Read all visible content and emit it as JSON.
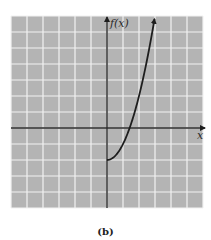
{
  "chart_data": {
    "type": "line",
    "title": "",
    "caption": "(b)",
    "xlabel": "x",
    "ylabel": "f(x)",
    "grid": true,
    "xlim": [
      -6,
      6
    ],
    "ylim": [
      -5,
      7
    ],
    "unit_px": 16,
    "function": "f(x) = x^2 - 2, x >= 0",
    "series": [
      {
        "name": "f(x)",
        "x": [
          0,
          0.5,
          1,
          1.414,
          2,
          2.5,
          3
        ],
        "y": [
          -2,
          -1.75,
          -1,
          0,
          2,
          4.25,
          7
        ]
      }
    ],
    "endpoint_arrow": "top",
    "colors": {
      "grid_background": "#b4b4b4",
      "grid_lines": "#f2f2f2",
      "axes": "#2a2a2a",
      "curve": "#1e1e1e"
    }
  },
  "labels": {
    "y_axis": "f(x)",
    "x_axis": "x",
    "caption": "(b)"
  }
}
